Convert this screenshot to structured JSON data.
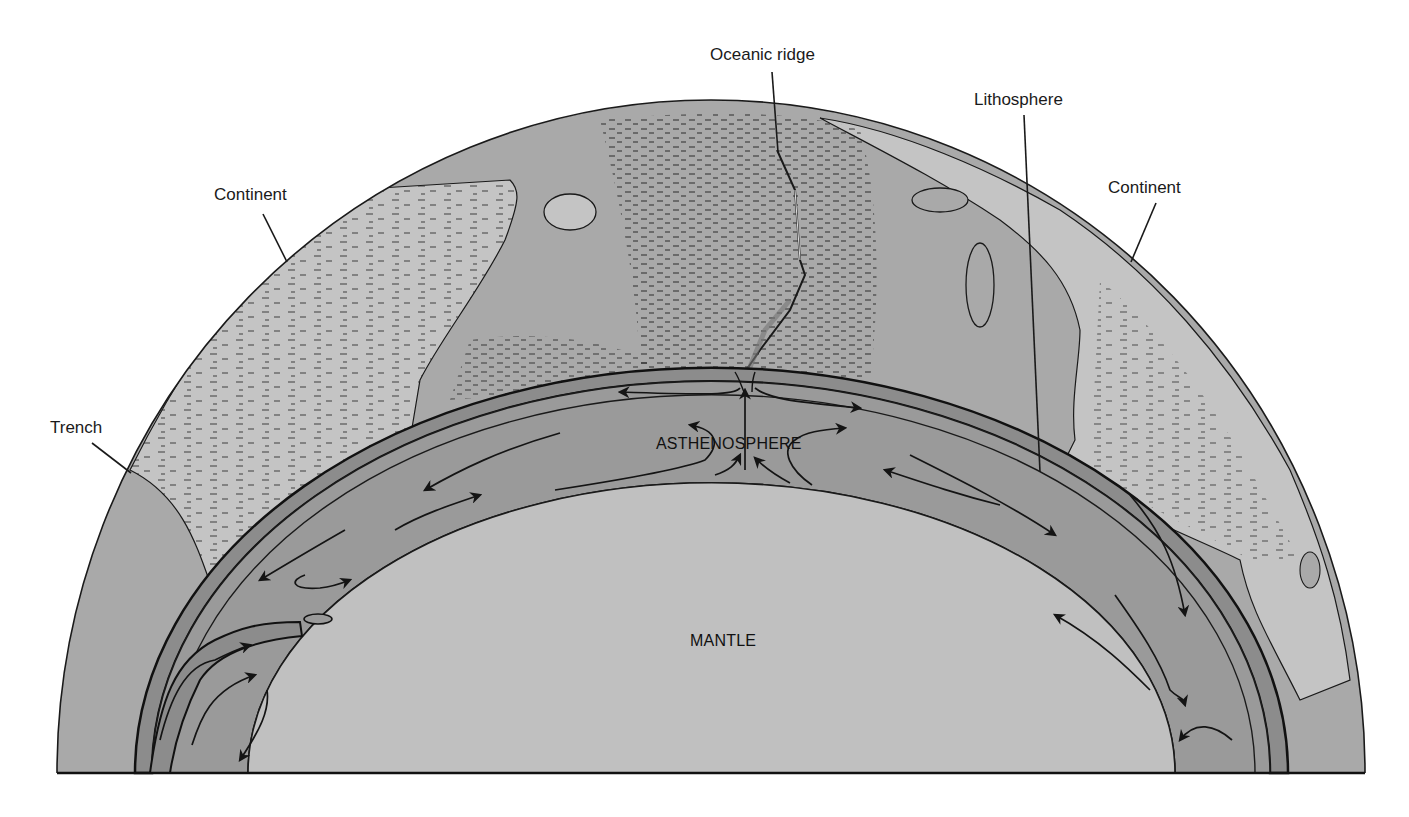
{
  "figure": {
    "colors": {
      "background": "#ffffff",
      "continent": "#c4c4c4",
      "ocean_floor": "#a9a9a9",
      "asthenosphere": "#9a9a9a",
      "lithosphere_band": "#8c8c8c",
      "mantle": "#c0c0c0",
      "ink": "#141414"
    }
  },
  "labels": {
    "oceanic_ridge": "Oceanic ridge",
    "lithosphere": "Lithosphere",
    "continent_left": "Continent",
    "continent_right": "Continent",
    "trench": "Trench",
    "asthenosphere": "ASTHENOSPHERE",
    "mantle": "MANTLE"
  }
}
